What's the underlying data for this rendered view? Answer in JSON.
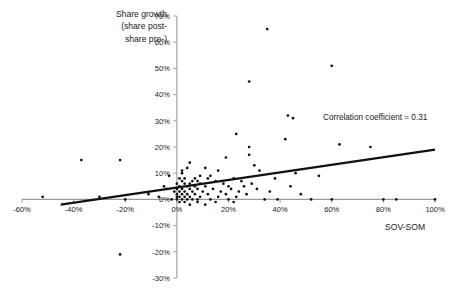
{
  "chart_data": {
    "type": "scatter",
    "title": "",
    "ylabel": "Share growth\n(share post-\nshare pre-)",
    "xlabel": "SOV-SOM",
    "xlim": [
      -60,
      100
    ],
    "ylim": [
      -30,
      70
    ],
    "xticks": [
      "-60%",
      "-40%",
      "-20%",
      "0%",
      "20%",
      "40%",
      "60%",
      "80%",
      "100%"
    ],
    "xtick_values": [
      -60,
      -40,
      -20,
      0,
      20,
      40,
      60,
      80,
      100
    ],
    "yticks": [
      "-30%",
      "-20%",
      "-10%",
      "0%",
      "10%",
      "20%",
      "30%",
      "40%",
      "50%",
      "60%",
      "70%"
    ],
    "ytick_values": [
      -30,
      -20,
      -10,
      0,
      10,
      20,
      30,
      40,
      50,
      60,
      70
    ],
    "grid": false,
    "legend": false,
    "annotations": [
      {
        "text": "Correlation coefficient = 0.31",
        "x": 45,
        "y": 31,
        "marker": true
      }
    ],
    "trendline": {
      "x": [
        -45,
        100
      ],
      "y": [
        -2.0,
        19.0
      ],
      "slope": 0.1448,
      "intercept": 4.52
    },
    "points": [
      [
        35,
        65
      ],
      [
        60,
        51
      ],
      [
        28,
        45
      ],
      [
        43,
        32
      ],
      [
        23,
        25
      ],
      [
        42,
        23
      ],
      [
        63,
        21
      ],
      [
        28,
        20
      ],
      [
        75,
        20
      ],
      [
        28,
        17
      ],
      [
        -37,
        15
      ],
      [
        -22,
        15
      ],
      [
        19,
        16
      ],
      [
        5,
        14
      ],
      [
        30,
        13
      ],
      [
        4,
        12
      ],
      [
        11,
        12
      ],
      [
        2,
        11
      ],
      [
        16,
        11
      ],
      [
        32,
        11
      ],
      [
        2,
        10
      ],
      [
        46,
        10
      ],
      [
        -3,
        9
      ],
      [
        9,
        9
      ],
      [
        13,
        9
      ],
      [
        55,
        9
      ],
      [
        1,
        8
      ],
      [
        3,
        8
      ],
      [
        7,
        8
      ],
      [
        12,
        8
      ],
      [
        22,
        8
      ],
      [
        38,
        8
      ],
      [
        2,
        7
      ],
      [
        6,
        7
      ],
      [
        8,
        7
      ],
      [
        15,
        7
      ],
      [
        25,
        7
      ],
      [
        0,
        6
      ],
      [
        3,
        6
      ],
      [
        5,
        6
      ],
      [
        9,
        6
      ],
      [
        18,
        6
      ],
      [
        29,
        6
      ],
      [
        -5,
        5
      ],
      [
        1,
        5
      ],
      [
        4,
        5
      ],
      [
        7,
        5
      ],
      [
        11,
        5
      ],
      [
        20,
        5
      ],
      [
        26,
        5
      ],
      [
        44,
        5
      ],
      [
        0,
        4
      ],
      [
        2,
        4
      ],
      [
        5,
        4
      ],
      [
        8,
        4
      ],
      [
        14,
        4
      ],
      [
        21,
        4
      ],
      [
        31,
        4
      ],
      [
        -1,
        3
      ],
      [
        1,
        3
      ],
      [
        3,
        3
      ],
      [
        6,
        3
      ],
      [
        10,
        3
      ],
      [
        17,
        3
      ],
      [
        24,
        3
      ],
      [
        36,
        3
      ],
      [
        0,
        2
      ],
      [
        2,
        2
      ],
      [
        4,
        2
      ],
      [
        7,
        2
      ],
      [
        12,
        2
      ],
      [
        19,
        2
      ],
      [
        27,
        2
      ],
      [
        48,
        2
      ],
      [
        0,
        1
      ],
      [
        1,
        1
      ],
      [
        3,
        1
      ],
      [
        5,
        1
      ],
      [
        9,
        1
      ],
      [
        16,
        1
      ],
      [
        23,
        1
      ],
      [
        -2,
        0
      ],
      [
        0,
        0
      ],
      [
        2,
        0
      ],
      [
        4,
        0
      ],
      [
        6,
        0
      ],
      [
        8,
        0
      ],
      [
        13,
        0
      ],
      [
        20,
        0
      ],
      [
        34,
        0
      ],
      [
        39,
        0
      ],
      [
        52,
        0
      ],
      [
        60,
        0
      ],
      [
        80,
        0
      ],
      [
        85,
        0
      ],
      [
        100,
        0
      ],
      [
        -20,
        0
      ],
      [
        -52,
        1
      ],
      [
        -30,
        1
      ],
      [
        -11,
        2
      ],
      [
        -7,
        1
      ],
      [
        -4,
        4
      ],
      [
        1,
        -1
      ],
      [
        3,
        -1
      ],
      [
        5,
        -2
      ],
      [
        8,
        -1
      ],
      [
        11,
        -2
      ],
      [
        15,
        -1
      ],
      [
        22,
        -1
      ],
      [
        -22,
        -21
      ]
    ]
  }
}
